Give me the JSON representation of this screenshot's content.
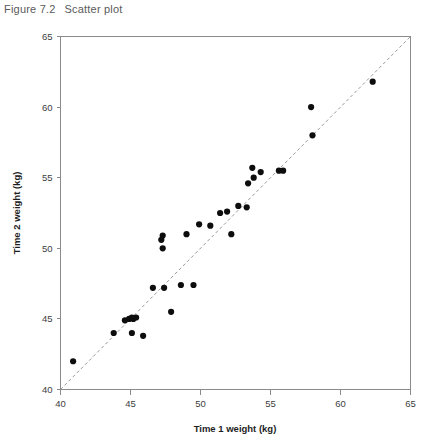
{
  "figure": {
    "caption_number": "Figure 7.2",
    "caption_text": "Scatter plot"
  },
  "chart_data": {
    "type": "scatter",
    "title": "Scatter plot",
    "xlabel": "Time 1 weight (kg)",
    "ylabel": "Time 2 weight (kg)",
    "xlim": [
      40,
      65
    ],
    "ylim": [
      40,
      65
    ],
    "xticks": [
      40,
      45,
      50,
      55,
      60,
      65
    ],
    "yticks": [
      40,
      45,
      50,
      55,
      60,
      65
    ],
    "grid": false,
    "legend": false,
    "marker_color": "#0d0d0d",
    "reference_line": {
      "type": "identity",
      "label": "y = x",
      "style": "dashed",
      "color": "#9a9a9a",
      "from": [
        40,
        40
      ],
      "to": [
        65,
        65
      ]
    },
    "series": [
      {
        "name": "Participants",
        "points": [
          [
            40.9,
            42.0
          ],
          [
            43.8,
            44.0
          ],
          [
            44.6,
            44.9
          ],
          [
            44.9,
            45.0
          ],
          [
            45.1,
            45.1
          ],
          [
            45.2,
            45.0
          ],
          [
            45.4,
            45.1
          ],
          [
            45.1,
            44.0
          ],
          [
            45.9,
            43.8
          ],
          [
            46.6,
            47.2
          ],
          [
            47.2,
            50.6
          ],
          [
            47.3,
            50.9
          ],
          [
            47.3,
            50.0
          ],
          [
            47.4,
            47.2
          ],
          [
            47.9,
            45.5
          ],
          [
            48.6,
            47.4
          ],
          [
            49.0,
            51.0
          ],
          [
            49.5,
            47.4
          ],
          [
            49.9,
            51.7
          ],
          [
            50.7,
            51.6
          ],
          [
            51.4,
            52.5
          ],
          [
            51.9,
            52.6
          ],
          [
            52.2,
            51.0
          ],
          [
            52.7,
            53.0
          ],
          [
            53.3,
            52.9
          ],
          [
            53.4,
            54.6
          ],
          [
            53.7,
            55.7
          ],
          [
            53.8,
            55.0
          ],
          [
            54.3,
            55.4
          ],
          [
            55.6,
            55.5
          ],
          [
            55.9,
            55.5
          ],
          [
            57.9,
            60.0
          ],
          [
            58.0,
            58.0
          ],
          [
            62.3,
            61.8
          ]
        ]
      }
    ]
  }
}
